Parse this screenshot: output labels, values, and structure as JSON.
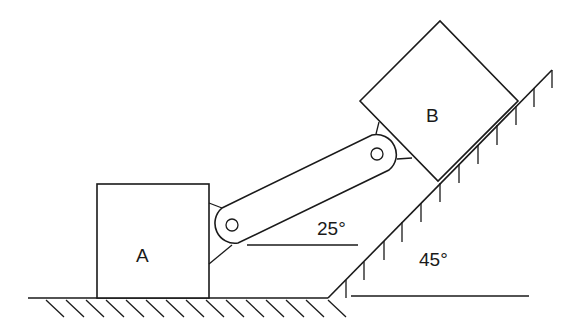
{
  "diagram": {
    "type": "mechanism",
    "labels": {
      "block_a": "A",
      "block_b": "B",
      "link_angle": "25°",
      "incline_angle": "45°"
    },
    "colors": {
      "line": "#1a1a1a",
      "background": "#ffffff"
    }
  }
}
